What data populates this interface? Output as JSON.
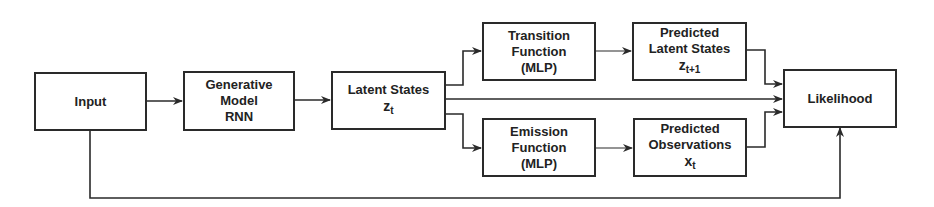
{
  "diagram": {
    "nodes": {
      "input": {
        "lines": [
          "Input"
        ]
      },
      "generative": {
        "lines": [
          "Generative",
          "Model",
          "RNN"
        ]
      },
      "latent": {
        "lines": [
          "Latent States"
        ],
        "symbol": "z",
        "subscript": "t"
      },
      "transition": {
        "lines": [
          "Transition",
          "Function",
          "(MLP)"
        ]
      },
      "pred_latent": {
        "lines": [
          "Predicted",
          "Latent States"
        ],
        "symbol": "z",
        "subscript": "t+1"
      },
      "emission": {
        "lines": [
          "Emission",
          "Function",
          "(MLP)"
        ]
      },
      "pred_obs": {
        "lines": [
          "Predicted",
          "Observations"
        ],
        "symbol": "x",
        "subscript": "t"
      },
      "likelihood": {
        "lines": [
          "Likelihood"
        ]
      }
    },
    "edges": [
      [
        "input",
        "generative"
      ],
      [
        "generative",
        "latent"
      ],
      [
        "latent",
        "transition"
      ],
      [
        "latent",
        "emission"
      ],
      [
        "latent",
        "likelihood"
      ],
      [
        "transition",
        "pred_latent"
      ],
      [
        "emission",
        "pred_obs"
      ],
      [
        "pred_latent",
        "likelihood"
      ],
      [
        "pred_obs",
        "likelihood"
      ],
      [
        "input",
        "likelihood"
      ]
    ],
    "colors": {
      "stroke": "#2a2a2a",
      "background": "#ffffff",
      "text": "#222222"
    }
  }
}
